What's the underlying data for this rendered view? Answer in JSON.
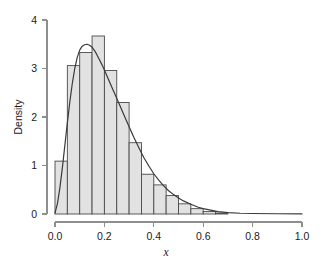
{
  "chart_data": {
    "type": "bar",
    "title": "",
    "subtitle": "",
    "xlabel": "x",
    "ylabel": "Density",
    "xlim": [
      0.0,
      1.0
    ],
    "ylim": [
      0.0,
      4.0
    ],
    "grid": false,
    "legend": null,
    "bin_width": 0.05,
    "categories": [
      "0.00-0.05",
      "0.05-0.10",
      "0.10-0.15",
      "0.15-0.20",
      "0.20-0.25",
      "0.25-0.30",
      "0.30-0.35",
      "0.35-0.40",
      "0.40-0.45",
      "0.45-0.50",
      "0.50-0.55",
      "0.55-0.60",
      "0.60-0.65",
      "0.65-0.70"
    ],
    "bin_edges": [
      0.0,
      0.05,
      0.1,
      0.15,
      0.2,
      0.25,
      0.3,
      0.35,
      0.4,
      0.45,
      0.5,
      0.55,
      0.6,
      0.65,
      0.7
    ],
    "values": [
      1.09,
      3.06,
      3.33,
      3.67,
      2.96,
      2.3,
      1.47,
      0.82,
      0.6,
      0.38,
      0.21,
      0.11,
      0.05,
      0.02
    ],
    "xticks": [
      0.0,
      0.2,
      0.4,
      0.6,
      0.8,
      1.0
    ],
    "xtick_labels": [
      "0.0",
      "0.2",
      "0.4",
      "0.6",
      "0.8",
      "1.0"
    ],
    "yticks": [
      0,
      1,
      2,
      3,
      4
    ],
    "ytick_labels": [
      "0",
      "1",
      "2",
      "3",
      "4"
    ],
    "series": [
      {
        "name": "histogram",
        "type": "bar",
        "values": [
          1.09,
          3.06,
          3.33,
          3.67,
          2.96,
          2.3,
          1.47,
          0.82,
          0.6,
          0.38,
          0.21,
          0.11,
          0.05,
          0.02
        ]
      },
      {
        "name": "density",
        "type": "line",
        "x": [
          0.0,
          0.01,
          0.02,
          0.03,
          0.04,
          0.05,
          0.06,
          0.07,
          0.08,
          0.09,
          0.1,
          0.11,
          0.12,
          0.13,
          0.14,
          0.15,
          0.16,
          0.17,
          0.18,
          0.19,
          0.2,
          0.22,
          0.24,
          0.26,
          0.28,
          0.3,
          0.32,
          0.34,
          0.36,
          0.38,
          0.4,
          0.42,
          0.44,
          0.46,
          0.48,
          0.5,
          0.52,
          0.55,
          0.58,
          0.6,
          0.63,
          0.66,
          0.7,
          0.75,
          0.8,
          0.9,
          1.0
        ],
        "y": [
          0.02,
          0.22,
          0.55,
          0.96,
          1.42,
          1.88,
          2.31,
          2.69,
          3.0,
          3.23,
          3.38,
          3.46,
          3.49,
          3.5,
          3.48,
          3.44,
          3.37,
          3.28,
          3.18,
          3.08,
          2.97,
          2.73,
          2.5,
          2.27,
          2.03,
          1.8,
          1.57,
          1.36,
          1.16,
          0.99,
          0.83,
          0.7,
          0.58,
          0.48,
          0.4,
          0.33,
          0.27,
          0.2,
          0.14,
          0.11,
          0.08,
          0.05,
          0.03,
          0.015,
          0.01,
          0.005,
          0.003
        ]
      }
    ],
    "colors": {
      "bar_fill": "#e2e2e2",
      "bar_stroke": "#4a4a4a",
      "curve": "#3a3a3a",
      "axis": "#8e8e8e",
      "text": "#1b1b1b"
    }
  }
}
